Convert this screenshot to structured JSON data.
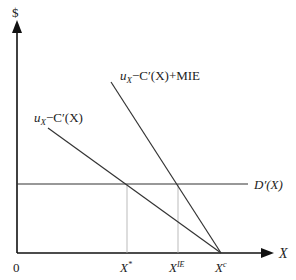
{
  "diagram": {
    "y_axis_label": "$",
    "x_axis_label": "X",
    "origin_label": "0",
    "curves": {
      "marginal_private": {
        "label_u": "u",
        "label_sub": "X",
        "label_rest": "−C′(X)"
      },
      "marginal_with_mie": {
        "label_u": "u",
        "label_sub": "X",
        "label_rest": "−C′(X)+MIE"
      },
      "demand": {
        "label": "D′(X)"
      }
    },
    "x_ticks": [
      {
        "base": "X",
        "sup": "*"
      },
      {
        "base": "X",
        "sup": "IE"
      },
      {
        "base": "X",
        "sup": "c"
      }
    ],
    "colors": {
      "line": "#333333",
      "axis": "#111111",
      "dotted": "#999999"
    }
  }
}
